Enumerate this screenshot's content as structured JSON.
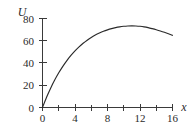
{
  "chart_data": {
    "type": "line",
    "title": "",
    "subtitle": "",
    "xlabel": "x",
    "ylabel": "U",
    "xlim": [
      0,
      16
    ],
    "ylim": [
      0,
      80
    ],
    "grid": false,
    "legend": false,
    "x_ticks_major": [
      0,
      4,
      8,
      12,
      16
    ],
    "x_tick_labels": [
      "0",
      "4",
      "8",
      "12",
      "16"
    ],
    "x_ticks_minor": [
      2,
      6,
      10,
      14
    ],
    "y_ticks_major": [
      0,
      20,
      40,
      60,
      80
    ],
    "y_tick_labels": [
      "0",
      "20",
      "40",
      "60",
      "80"
    ],
    "series": [
      {
        "name": "U(x)",
        "color": "#2a2a2a",
        "x": [
          0,
          0.5,
          1,
          1.5,
          2,
          2.5,
          3,
          3.5,
          4,
          4.5,
          5,
          5.5,
          6,
          6.5,
          7,
          7.5,
          8,
          8.5,
          9,
          9.5,
          10,
          10.5,
          11,
          11.5,
          12,
          12.5,
          13,
          13.5,
          14,
          14.5,
          15,
          15.5,
          16
        ],
        "values": [
          0,
          9.2,
          17.4,
          24.7,
          31.2,
          37.0,
          42.2,
          46.8,
          50.9,
          54.5,
          57.7,
          60.5,
          63.0,
          65.1,
          66.9,
          68.5,
          69.8,
          70.9,
          71.8,
          72.5,
          73.0,
          73.3,
          73.4,
          73.3,
          73.0,
          72.5,
          71.8,
          70.9,
          69.9,
          68.8,
          67.6,
          66.3,
          64.9
        ]
      }
    ],
    "annotations": {
      "peak_x": 10.8,
      "peak_value": 73.4,
      "endpoint_x": 16,
      "endpoint_value": 64.9,
      "origin_value": 0
    }
  },
  "axes": {
    "y_axis_label": "U",
    "x_axis_label": "x"
  }
}
